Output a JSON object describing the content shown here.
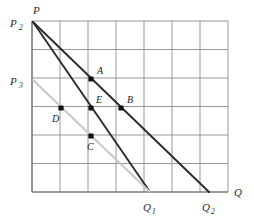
{
  "figure": {
    "kind": "economics-demand-curve-diagram",
    "background": "#ffffff",
    "grid_color": "#8d8d8d",
    "axis_color": "#6f6f6f",
    "dark_line_color": "#2b2b2b",
    "light_line_color": "#c8c8c8",
    "point_color": "#111111"
  },
  "axes": {
    "price_axis_label": "P",
    "quantity_axis_label": "Q",
    "x_min_px": 32,
    "x_max_px": 228,
    "y_min_px": 21,
    "y_max_px": 192,
    "grid_cols": 7,
    "grid_rows": 6
  },
  "axis_ticks": [
    {
      "name": "P2",
      "base": "P",
      "sub": "2",
      "x": 10,
      "y": 27,
      "subx": 19,
      "suby": 30
    },
    {
      "name": "P3",
      "base": "P",
      "sub": "3",
      "x": 10,
      "y": 85,
      "subx": 19,
      "suby": 88
    },
    {
      "name": "Q1",
      "base": "Q",
      "sub": "1",
      "x": 143,
      "y": 211,
      "subx": 152,
      "suby": 214
    },
    {
      "name": "Q2",
      "base": "Q",
      "sub": "2",
      "x": 202,
      "y": 211,
      "subx": 211,
      "suby": 214
    }
  ],
  "curves": [
    {
      "name": "demand-curve-steep",
      "style": "dark",
      "from_label": "P2",
      "to_label": "Q1",
      "x1": 33,
      "y1": 22,
      "x2": 150,
      "y2": 192
    },
    {
      "name": "demand-curve-shallow",
      "style": "dark",
      "from_label": "P2",
      "to_label": "Q2",
      "x1": 33,
      "y1": 22,
      "x2": 209,
      "y2": 192
    },
    {
      "name": "demand-curve-shifted",
      "style": "light",
      "from_label": "P3",
      "to_label": "Q1",
      "x1": 33,
      "y1": 80,
      "x2": 150,
      "y2": 192
    }
  ],
  "points": [
    {
      "label": "A",
      "x": 91,
      "y": 79,
      "lx": 97,
      "ly": 74
    },
    {
      "label": "B",
      "x": 121,
      "y": 108,
      "lx": 127,
      "ly": 103
    },
    {
      "label": "C",
      "x": 91,
      "y": 136,
      "lx": 87,
      "ly": 150
    },
    {
      "label": "D",
      "x": 61,
      "y": 108,
      "lx": 52,
      "ly": 122
    },
    {
      "label": "E",
      "x": 91,
      "y": 108,
      "lx": 96,
      "ly": 103
    }
  ],
  "chart_data": {
    "type": "line",
    "title": "",
    "xlabel": "Q",
    "ylabel": "P",
    "grid": true,
    "legend": "none",
    "xlim": [
      0,
      7
    ],
    "ylim": [
      0,
      6
    ],
    "series": [
      {
        "name": "demand-curve-steep",
        "color": "#2b2b2b",
        "x": [
          0,
          4.2
        ],
        "y": [
          6,
          0
        ]
      },
      {
        "name": "demand-curve-shallow",
        "color": "#2b2b2b",
        "x": [
          0,
          6.3
        ],
        "y": [
          6,
          0
        ]
      },
      {
        "name": "demand-curve-shifted",
        "color": "#c8c8c8",
        "x": [
          0,
          4.2
        ],
        "y": [
          4,
          0
        ]
      }
    ],
    "annotations": [
      {
        "label": "A",
        "x": 2,
        "y": 4
      },
      {
        "label": "B",
        "x": 3,
        "y": 3
      },
      {
        "label": "C",
        "x": 2,
        "y": 2
      },
      {
        "label": "D",
        "x": 1,
        "y": 3
      },
      {
        "label": "E",
        "x": 2,
        "y": 3
      },
      {
        "label": "P2",
        "x": 0,
        "y": 6
      },
      {
        "label": "P3",
        "x": 0,
        "y": 4
      },
      {
        "label": "Q1",
        "x": 4.2,
        "y": 0
      },
      {
        "label": "Q2",
        "x": 6.3,
        "y": 0
      }
    ]
  }
}
